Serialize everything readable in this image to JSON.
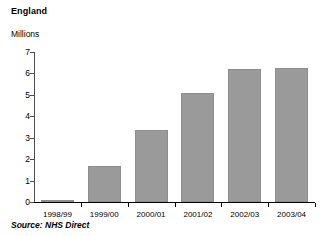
{
  "chart_data": {
    "type": "bar",
    "title": "England",
    "subtitle": "",
    "xlabel": "",
    "ylabel": "Millions",
    "categories": [
      "1998/99",
      "1999/00",
      "2000/01",
      "2001/02",
      "2002/03",
      "2003/04"
    ],
    "values": [
      0.1,
      1.7,
      3.35,
      5.1,
      6.2,
      6.25
    ],
    "series": [
      {
        "name": "NHS Direct calls",
        "values": [
          0.1,
          1.7,
          3.35,
          5.1,
          6.2,
          6.25
        ]
      }
    ],
    "ylim": [
      0,
      7
    ],
    "ytick_labels": [
      "0",
      "1",
      "2",
      "3",
      "4",
      "5",
      "6",
      "7"
    ],
    "ytick_values": [
      0,
      1,
      2,
      3,
      4,
      5,
      6,
      7
    ],
    "grid": false,
    "legend": false,
    "legend_position": "none",
    "bar_color": "#9a9a9a",
    "axis_color": "#000000",
    "text_color": "#000000",
    "background_color": "#ffffff",
    "source_note": "Source: NHS Direct",
    "units": "Millions"
  },
  "header": {
    "title": "England",
    "unit_label": "Millions"
  },
  "footer": {
    "source": "Source: NHS Direct"
  }
}
